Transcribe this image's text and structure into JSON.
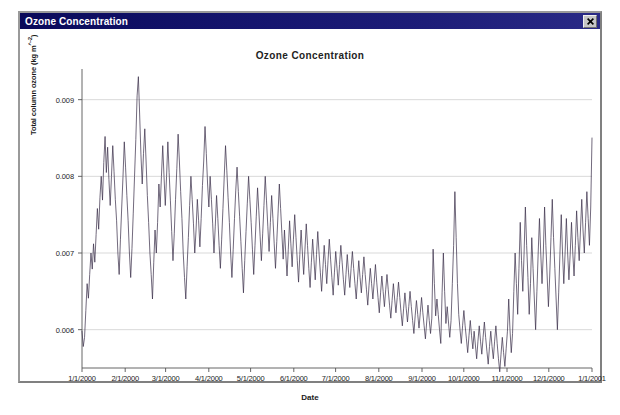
{
  "window": {
    "title": "Ozone Concentration",
    "close_icon": "close-icon",
    "close_label": "✕"
  },
  "chart_data": {
    "type": "line",
    "title": "Ozone Concentration",
    "xlabel": "Date",
    "ylabel": "Total column ozone (kg m^-2)",
    "grid": true,
    "legend": "none",
    "ylim": [
      0.0055,
      0.0094
    ],
    "yticks": [
      0.006,
      0.007,
      0.008,
      0.009
    ],
    "ytick_labels": [
      "0.006",
      "0.007",
      "0.008",
      "0.009"
    ],
    "xlim": [
      "1/1/2000",
      "1/1/2001"
    ],
    "xtick_labels": [
      "1/1/2000",
      "2/1/2000",
      "3/1/2000",
      "4/1/2000",
      "5/1/2000",
      "6/1/2000",
      "7/1/2000",
      "8/1/2000",
      "9/1/2000",
      "10/1/2000",
      "11/1/2000",
      "12/1/2000",
      "1/1/2001"
    ],
    "xtick_days": [
      0,
      31,
      60,
      91,
      121,
      152,
      182,
      213,
      244,
      274,
      305,
      335,
      366
    ],
    "line_color": "#3a2f4a",
    "grid_color": "#c9c9c9",
    "axis_color": "#555555",
    "series": [
      {
        "name": "Total column ozone",
        "x_unit": "day-of-year-2000",
        "values": [
          0.00598,
          0.00578,
          0.0059,
          0.00625,
          0.0066,
          0.00641,
          0.00672,
          0.007,
          0.00679,
          0.00712,
          0.00688,
          0.00724,
          0.00758,
          0.00731,
          0.00772,
          0.008,
          0.00769,
          0.00818,
          0.00852,
          0.00805,
          0.00838,
          0.00796,
          0.00762,
          0.008,
          0.0084,
          0.00806,
          0.0077,
          0.00742,
          0.007,
          0.00672,
          0.00718,
          0.0076,
          0.008,
          0.00845,
          0.00812,
          0.00775,
          0.00742,
          0.007,
          0.00668,
          0.00706,
          0.00752,
          0.008,
          0.00848,
          0.00905,
          0.0093,
          0.0088,
          0.00828,
          0.0079,
          0.0083,
          0.00862,
          0.0082,
          0.00775,
          0.0074,
          0.007,
          0.00672,
          0.0064,
          0.00688,
          0.0073,
          0.007,
          0.0074,
          0.0079,
          0.0076,
          0.008,
          0.0084,
          0.008,
          0.00762,
          0.008,
          0.00845,
          0.00805,
          0.00768,
          0.00728,
          0.0069,
          0.00725,
          0.0077,
          0.0081,
          0.00855,
          0.0082,
          0.0078,
          0.00745,
          0.007,
          0.00668,
          0.0064,
          0.00682,
          0.0072,
          0.00762,
          0.008,
          0.0077,
          0.00738,
          0.007,
          0.0073,
          0.0077,
          0.00742,
          0.00708,
          0.00745,
          0.00788,
          0.0082,
          0.00865,
          0.0083,
          0.0079,
          0.0076,
          0.008,
          0.0077,
          0.00738,
          0.007,
          0.00735,
          0.00775,
          0.00745,
          0.0071,
          0.0068,
          0.00718,
          0.00758,
          0.008,
          0.0084,
          0.00808,
          0.00772,
          0.0074,
          0.007,
          0.00668,
          0.00705,
          0.00745,
          0.00782,
          0.00812,
          0.0078,
          0.00748,
          0.00715,
          0.0068,
          0.00648,
          0.0069,
          0.00728,
          0.00765,
          0.008,
          0.0077,
          0.0074,
          0.00705,
          0.00672,
          0.0071,
          0.00748,
          0.00785,
          0.00755,
          0.00722,
          0.0069,
          0.00725,
          0.00762,
          0.008,
          0.00768,
          0.00735,
          0.00702,
          0.0074,
          0.00775,
          0.00745,
          0.00712,
          0.0068,
          0.00715,
          0.00752,
          0.0079,
          0.00758,
          0.00725,
          0.00692,
          0.0073,
          0.007,
          0.0067,
          0.00705,
          0.00742,
          0.00712,
          0.00682,
          0.00718,
          0.0075,
          0.0072,
          0.0069,
          0.00662,
          0.00698,
          0.0073,
          0.007,
          0.00672,
          0.00705,
          0.00738,
          0.0071,
          0.0068,
          0.00655,
          0.00688,
          0.00718,
          0.00692,
          0.00665,
          0.00698,
          0.00728,
          0.007,
          0.00675,
          0.0065,
          0.0068,
          0.0071,
          0.00685,
          0.0066,
          0.0069,
          0.00718,
          0.00692,
          0.00668,
          0.00645,
          0.00675,
          0.00702,
          0.0068,
          0.00658,
          0.00685,
          0.0071,
          0.00688,
          0.00665,
          0.00645,
          0.00672,
          0.00698,
          0.00675,
          0.00655,
          0.0068,
          0.00702,
          0.0068,
          0.0066,
          0.0064,
          0.00665,
          0.0069,
          0.00668,
          0.00648,
          0.00672,
          0.00695,
          0.00672,
          0.00652,
          0.00632,
          0.00658,
          0.0068,
          0.0066,
          0.0064,
          0.00662,
          0.00685,
          0.00662,
          0.00642,
          0.00622,
          0.00648,
          0.0067,
          0.0065,
          0.0063,
          0.00652,
          0.00672,
          0.00652,
          0.00632,
          0.00615,
          0.00638,
          0.0066,
          0.0064,
          0.00622,
          0.00642,
          0.00662,
          0.00642,
          0.00622,
          0.00605,
          0.00628,
          0.00648,
          0.00628,
          0.0061,
          0.0063,
          0.0065,
          0.0063,
          0.00612,
          0.00595,
          0.00618,
          0.00638,
          0.0062,
          0.00602,
          0.00622,
          0.00642,
          0.00622,
          0.00605,
          0.00588,
          0.0061,
          0.00632,
          0.00612,
          0.00595,
          0.00615,
          0.00705,
          0.0066,
          0.00618,
          0.0064,
          0.0062,
          0.006,
          0.00582,
          0.00648,
          0.007,
          0.0065,
          0.00608,
          0.0063,
          0.0061,
          0.0059,
          0.00612,
          0.0066,
          0.0071,
          0.0078,
          0.0072,
          0.0066,
          0.0062,
          0.006,
          0.00582,
          0.00605,
          0.00625,
          0.00605,
          0.00588,
          0.0057,
          0.00592,
          0.00612,
          0.00592,
          0.00575,
          0.00598,
          0.0058,
          0.00562,
          0.00585,
          0.00605,
          0.00585,
          0.00568,
          0.0059,
          0.0061,
          0.0059,
          0.00572,
          0.00555,
          0.00578,
          0.00598,
          0.00578,
          0.00562,
          0.00585,
          0.00605,
          0.00582,
          0.00562,
          0.00545,
          0.00568,
          0.0059,
          0.0057,
          0.00552,
          0.00575,
          0.00598,
          0.0064,
          0.006,
          0.0057,
          0.00595,
          0.0065,
          0.007,
          0.0066,
          0.0062,
          0.0068,
          0.0074,
          0.0069,
          0.0065,
          0.007,
          0.0076,
          0.0071,
          0.00668,
          0.0062,
          0.0066,
          0.0072,
          0.0068,
          0.0064,
          0.006,
          0.0065,
          0.007,
          0.00745,
          0.007,
          0.0066,
          0.007,
          0.0076,
          0.0071,
          0.0067,
          0.0063,
          0.0067,
          0.0072,
          0.0077,
          0.0072,
          0.0068,
          0.0064,
          0.006,
          0.00648,
          0.007,
          0.0075,
          0.007,
          0.0066,
          0.007,
          0.00745,
          0.007,
          0.00665,
          0.007,
          0.0074,
          0.007,
          0.0067,
          0.0071,
          0.00755,
          0.0072,
          0.0069,
          0.0073,
          0.0077,
          0.0073,
          0.007,
          0.0074,
          0.0078,
          0.00745,
          0.0071,
          0.0076,
          0.0085
        ]
      }
    ]
  }
}
